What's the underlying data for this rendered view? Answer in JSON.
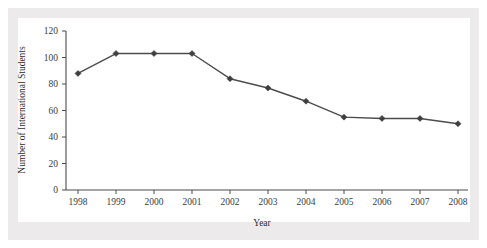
{
  "chart_data": {
    "type": "line",
    "title": "",
    "subtitle": "",
    "xlabel": "Year",
    "ylabel": "Number of International Students",
    "categories": [
      "1998",
      "1999",
      "2000",
      "2001",
      "2002",
      "2003",
      "2004",
      "2005",
      "2006",
      "2007",
      "2008"
    ],
    "x": [
      1998,
      1999,
      2000,
      2001,
      2002,
      2003,
      2004,
      2005,
      2006,
      2007,
      2008
    ],
    "values": [
      88,
      103,
      103,
      103,
      84,
      77,
      67,
      55,
      54,
      54,
      50
    ],
    "series": [
      {
        "name": "Number of International Students",
        "values": [
          88,
          103,
          103,
          103,
          84,
          77,
          67,
          55,
          54,
          54,
          50
        ]
      }
    ],
    "ylim": [
      0,
      120
    ],
    "yticks": [
      0,
      20,
      40,
      60,
      80,
      100,
      120
    ],
    "ytick_labels": [
      "0",
      "20",
      "40",
      "60",
      "80",
      "100",
      "120"
    ],
    "xticks": [
      1998,
      1999,
      2000,
      2001,
      2002,
      2003,
      2004,
      2005,
      2006,
      2007,
      2008
    ],
    "xtick_labels": [
      "1998",
      "1999",
      "2000",
      "2001",
      "2002",
      "2003",
      "2004",
      "2005",
      "2006",
      "2007",
      "2008"
    ],
    "grid": false,
    "legend": false,
    "legend_position": "none",
    "marker": "diamond",
    "line_color": "#4c4c4c",
    "marker_color": "#3f3f3f",
    "axis_color": "#4a4a4a",
    "plot_background": "#ffffff",
    "figure_background": "#eceaea",
    "annotations": []
  }
}
